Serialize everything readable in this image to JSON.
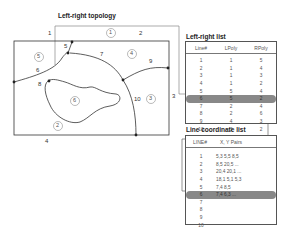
{
  "topology": {
    "title": "Left-right topology",
    "line_labels": [
      "1",
      "2",
      "3",
      "4",
      "5",
      "6",
      "7",
      "8",
      "9",
      "10"
    ],
    "polygon_labels": [
      "1",
      "2",
      "3",
      "4",
      "5",
      "6"
    ]
  },
  "left_right_list": {
    "title": "Left-right list",
    "headers": [
      "Line#",
      "LPoly",
      "RPoly"
    ],
    "rows": [
      [
        "1",
        "1",
        "5"
      ],
      [
        "2",
        "1",
        "4"
      ],
      [
        "3",
        "1",
        "3"
      ],
      [
        "4",
        "1",
        "2"
      ],
      [
        "5",
        "5",
        "4"
      ],
      [
        "6",
        "5",
        "2"
      ],
      [
        "7",
        "2",
        "4"
      ],
      [
        "8",
        "2",
        "6"
      ],
      [
        "9",
        "4",
        "3"
      ],
      [
        "10",
        "3",
        "2"
      ]
    ],
    "highlighted_row": 5
  },
  "line_coordinate_list": {
    "title": "Line coordinate list",
    "headers": [
      "LINE#",
      "X, Y Pairs"
    ],
    "rows": [
      [
        "1",
        "5,3 5,5 8,5"
      ],
      [
        "2",
        "8,5 20,5 ..."
      ],
      [
        "3",
        "20,4 20,1 ..."
      ],
      [
        "4",
        "18,1 5,1 5,3"
      ],
      [
        "5",
        "7,4 8,5"
      ],
      [
        "6",
        "7,4 6,3 ..."
      ],
      [
        "7",
        ""
      ],
      [
        "8",
        ""
      ],
      [
        "9",
        ""
      ],
      [
        "10",
        ""
      ]
    ],
    "highlighted_row": 5
  }
}
